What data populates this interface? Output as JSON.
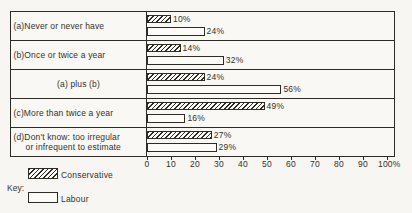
{
  "chart_data": {
    "type": "bar",
    "orientation": "horizontal",
    "title": "",
    "xlabel": "",
    "ylabel": "",
    "xlim": [
      0,
      100
    ],
    "grid": false,
    "x_ticks": [
      {
        "value": 0,
        "label": "0"
      },
      {
        "value": 10,
        "label": "10"
      },
      {
        "value": 20,
        "label": "20"
      },
      {
        "value": 30,
        "label": "30"
      },
      {
        "value": 40,
        "label": "40"
      },
      {
        "value": 50,
        "label": "50"
      },
      {
        "value": 60,
        "label": "60"
      },
      {
        "value": 70,
        "label": "70"
      },
      {
        "value": 80,
        "label": "80"
      },
      {
        "value": 90,
        "label": "90"
      },
      {
        "value": 100,
        "label": "100%"
      }
    ],
    "categories": [
      {
        "lines": [
          "(a)Never or never have"
        ],
        "align": "left"
      },
      {
        "lines": [
          "(b)Once or twice a year"
        ],
        "align": "left"
      },
      {
        "lines": [
          "(a) plus (b)"
        ],
        "align": "center"
      },
      {
        "lines": [
          "(c)More than twice a year"
        ],
        "align": "left"
      },
      {
        "lines": [
          "(d)Don't know: too irregular",
          "or infrequent to estimate"
        ],
        "align": "left"
      }
    ],
    "series": [
      {
        "name": "Conservative",
        "pattern": "hatched",
        "values": [
          10,
          14,
          24,
          49,
          27
        ],
        "value_labels": [
          "10%",
          "14%",
          "24%",
          "49%",
          "27%"
        ]
      },
      {
        "name": "Labour",
        "pattern": "plain",
        "values": [
          24,
          32,
          56,
          16,
          29
        ],
        "value_labels": [
          "24%",
          "32%",
          "56%",
          "16%",
          "29%"
        ]
      }
    ],
    "legend": {
      "title": "Key:",
      "position": "bottom-left",
      "entries": [
        {
          "label": "Conservative",
          "pattern": "hatched"
        },
        {
          "label": "Labour",
          "pattern": "plain"
        }
      ]
    }
  },
  "colors": {
    "background": "#f7f6f2",
    "ink": "#2f2c26",
    "bar_fill": "#fcfbf7"
  }
}
